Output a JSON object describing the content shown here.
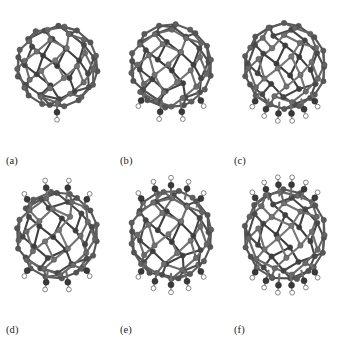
{
  "figure": {
    "background_color": "#ffffff",
    "panel_count": 6,
    "columns": 3,
    "rows": 2
  },
  "style": {
    "carbon_color": "#7d7d7d",
    "carbon_edge_color": "#4a4a4a",
    "bond_color": "#6e6e6e",
    "oxygen_color": "#3a3a3a",
    "hydrogen_color": "#ffffff",
    "hydrogen_edge_color": "#555555",
    "face_color": "#ffffff",
    "caption_color": "#1a1a1a"
  },
  "chart_data": {
    "type": "diagram",
    "title": "",
    "subtitle": "",
    "xlabel": "",
    "ylabel": "",
    "legend": [],
    "categories": [
      "(a)",
      "(b)",
      "(c)",
      "(d)",
      "(e)",
      "(f)"
    ],
    "values": [
      1,
      4,
      6,
      8,
      10,
      12
    ],
    "series": [
      {
        "name": "OH groups",
        "values": [
          1,
          4,
          6,
          8,
          10,
          12
        ]
      }
    ]
  },
  "panels": [
    {
      "id": "a",
      "caption": "(a)",
      "oh_count": 1,
      "oh_positions": "bottom",
      "cage": "C60 fullerene"
    },
    {
      "id": "b",
      "caption": "(b)",
      "oh_count": 4,
      "oh_positions": "bottom",
      "cage": "C60 fullerene"
    },
    {
      "id": "c",
      "caption": "(c)",
      "oh_count": 6,
      "oh_positions": "bottom",
      "cage": "C60 fullerene"
    },
    {
      "id": "d",
      "caption": "(d)",
      "oh_count": 8,
      "oh_positions": "bottom and top",
      "cage": "C60 fullerene"
    },
    {
      "id": "e",
      "caption": "(e)",
      "oh_count": 10,
      "oh_positions": "bottom and top",
      "cage": "C60 fullerene"
    },
    {
      "id": "f",
      "caption": "(f)",
      "oh_count": 12,
      "oh_positions": "bottom and top",
      "cage": "C60 fullerene"
    }
  ]
}
